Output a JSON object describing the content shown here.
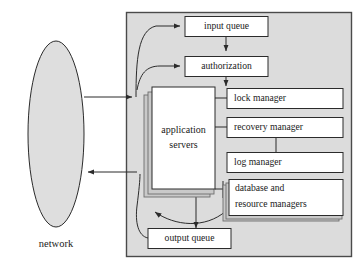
{
  "diagram": {
    "type": "block-diagram",
    "background_color": "#ffffff",
    "container_fill": "#dcdcdc",
    "box_fill": "#ffffff",
    "shadow_fill": "#c9c9c9",
    "stroke_color": "#2b2b2b",
    "external": {
      "network": {
        "label": "network",
        "shape": "ellipse"
      }
    },
    "container": {
      "name": "server-boundary",
      "label": ""
    },
    "nodes": {
      "input_queue": {
        "label": "input queue"
      },
      "authorization": {
        "label": "authorization"
      },
      "application_servers": {
        "label_line1": "application",
        "label_line2": "servers",
        "stacked": true
      },
      "lock_manager": {
        "label": "lock manager"
      },
      "recovery_manager": {
        "label": "recovery manager"
      },
      "log_manager": {
        "label": "log manager"
      },
      "database_resource_managers": {
        "label_line1": "database and",
        "label_line2": "resource managers",
        "stacked": true
      },
      "output_queue": {
        "label": "output queue"
      }
    },
    "edges": [
      {
        "from": "network",
        "to": "input queue",
        "arrow": true
      },
      {
        "from": "network",
        "to": "authorization",
        "arrow": true
      },
      {
        "from": "input queue",
        "to": "authorization",
        "arrow": true
      },
      {
        "from": "authorization",
        "to": "application servers",
        "arrow": true
      },
      {
        "from": "application servers",
        "to": "lock manager",
        "arrow": false
      },
      {
        "from": "application servers",
        "to": "recovery manager",
        "arrow": false
      },
      {
        "from": "recovery manager",
        "to": "log manager",
        "arrow": false
      },
      {
        "from": "application servers",
        "to": "database and resource managers",
        "arrow": false
      },
      {
        "from": "application servers",
        "to": "output queue",
        "arrow": true
      },
      {
        "from": "database and resource managers",
        "to": "output queue",
        "arrow": true
      },
      {
        "from": "output queue",
        "to": "network",
        "arrow": true
      }
    ]
  }
}
